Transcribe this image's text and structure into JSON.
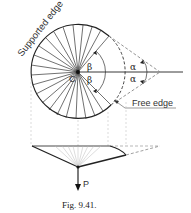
{
  "figure": {
    "caption": "Fig. 9.41.",
    "labels": {
      "supported_edge": "Supported edge",
      "free_edge": "Free edge",
      "center": "C",
      "beta_top": "β",
      "beta_bottom": "β",
      "alpha_top": "α",
      "alpha_bottom": "α",
      "load": "P"
    },
    "colors": {
      "line": "#222222",
      "dashed": "#888888",
      "projection": "#bbbbbb"
    }
  }
}
